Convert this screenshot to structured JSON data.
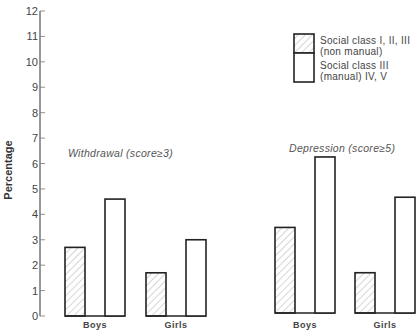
{
  "chart_data": {
    "type": "bar",
    "title": "",
    "xlabel": "",
    "ylabel": "Percentage",
    "ylim": [
      0,
      12
    ],
    "yticks": [
      0,
      1,
      2,
      3,
      4,
      5,
      6,
      7,
      8,
      9,
      10,
      11,
      12
    ],
    "grid": false,
    "legend_position": "top-right",
    "groups": [
      {
        "title": "Withdrawal (score≥3)",
        "categories": [
          "Boys",
          "Girls"
        ],
        "series": [
          {
            "name": "Social class I, II, III (non manual)",
            "pattern": "hatched",
            "values": [
              2.7,
              1.7
            ]
          },
          {
            "name": "Social class III (manual) IV, V",
            "pattern": "open",
            "values": [
              4.6,
              3.0
            ]
          }
        ]
      },
      {
        "title": "Depression (score≥5)",
        "categories": [
          "Boys",
          "Girls"
        ],
        "series": [
          {
            "name": "Social class I, II, III (non manual)",
            "pattern": "hatched",
            "values": [
              3.4,
              1.6
            ]
          },
          {
            "name": "Social class III (manual) IV, V",
            "pattern": "open",
            "values": [
              6.2,
              4.6
            ]
          }
        ]
      }
    ],
    "legend": [
      {
        "line1": "Social class I, II, III",
        "line2": "(non manual)",
        "pattern": "hatched"
      },
      {
        "line1": "Social class III",
        "line2": "(manual) IV, V",
        "pattern": "open"
      }
    ]
  },
  "colors": {
    "stroke": "#222222",
    "hatch": "#999999",
    "background": "#ffffff"
  }
}
